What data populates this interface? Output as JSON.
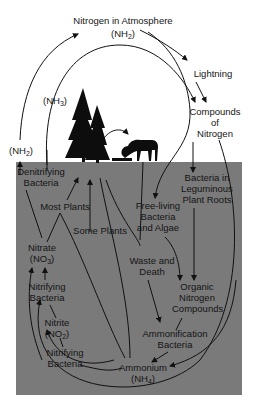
{
  "diagram": {
    "colors": {
      "soil": "#7a7a7a",
      "sky": "#ffffff",
      "ink": "#151515"
    },
    "above_ground": {
      "atmosphere": {
        "label": "Nitrogen in Atmosphere",
        "formula_prefix": "(NH",
        "formula_sub": "2",
        "formula_suffix": ")"
      },
      "nh3": {
        "prefix": "(NH",
        "sub": "3",
        "suffix": ")"
      },
      "nh2_left": {
        "prefix": "(NH",
        "sub": "2",
        "suffix": ")"
      },
      "lightning": "Lightning",
      "compounds": [
        "Compounds",
        "of",
        "Nitrogen"
      ],
      "icons": [
        "tree-icon",
        "tree-icon",
        "deer-icon"
      ]
    },
    "soil": {
      "denitrifying": [
        "Denitrifying",
        "Bacteria"
      ],
      "most_plants": "Most Plants",
      "some_plants": "Some Plants",
      "free_living": [
        "Free-living",
        "Bacteria",
        "and Algae"
      ],
      "leguminous": [
        "Bacteria in",
        "Leguminous",
        "Plant Roots"
      ],
      "nitrate": {
        "label": "Nitrate",
        "prefix": "(NO",
        "sub": "3",
        "suffix": ")"
      },
      "nitrifying_1": [
        "Nitrifying",
        "Bacteria"
      ],
      "nitrite": {
        "label": "Nitrite",
        "prefix": "(NO",
        "sub": "2",
        "suffix": ")"
      },
      "nitrifying_2": [
        "Nitrifying",
        "Bacteria"
      ],
      "waste": [
        "Waste and",
        "Death"
      ],
      "organic": [
        "Organic",
        "Nitrogen",
        "Compounds"
      ],
      "ammonification": [
        "Ammonification",
        "Bacteria"
      ],
      "ammonium": {
        "label": "Ammonium",
        "prefix": "(NH",
        "sub": "4",
        "suffix": ")"
      }
    }
  }
}
